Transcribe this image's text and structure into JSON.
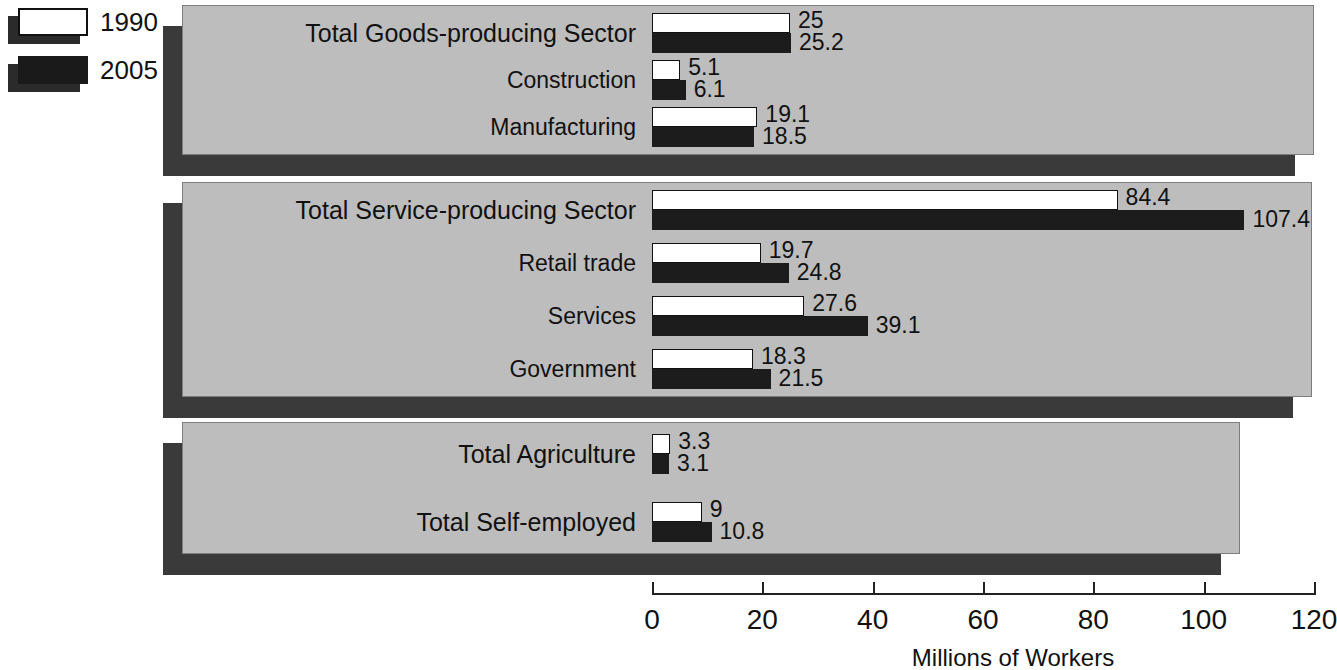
{
  "legend": {
    "items": [
      {
        "label": "1990",
        "swatch": "white-square-icon",
        "color": "#ffffff"
      },
      {
        "label": "2005",
        "swatch": "black-square-icon",
        "color": "#1a1a1a"
      }
    ]
  },
  "axis": {
    "title": "Millions of Workers",
    "ticks": [
      "0",
      "20",
      "40",
      "60",
      "80",
      "100",
      "120"
    ]
  },
  "chart_data": {
    "type": "bar",
    "orientation": "horizontal",
    "title": "",
    "xlabel": "Millions of Workers",
    "ylabel": "",
    "xlim": [
      0,
      120
    ],
    "xticks": [
      0,
      20,
      40,
      60,
      80,
      100,
      120
    ],
    "grid": false,
    "legend_position": "top-left",
    "series": [
      {
        "name": "1990",
        "color": "#ffffff"
      },
      {
        "name": "2005",
        "color": "#1a1a1a"
      }
    ],
    "groups": [
      {
        "name": "Goods-producing",
        "categories": [
          "Total Goods-producing Sector",
          "Construction",
          "Manufacturing"
        ],
        "rows": [
          {
            "label": "Total Goods-producing Sector",
            "emphasis": true,
            "v1990": 25,
            "v2005": 25.2,
            "t1990": "25",
            "t2005": "25.2"
          },
          {
            "label": "Construction",
            "emphasis": false,
            "v1990": 5.1,
            "v2005": 6.1,
            "t1990": "5.1",
            "t2005": "6.1"
          },
          {
            "label": "Manufacturing",
            "emphasis": false,
            "v1990": 19.1,
            "v2005": 18.5,
            "t1990": "19.1",
            "t2005": "18.5"
          }
        ]
      },
      {
        "name": "Service-producing",
        "categories": [
          "Total Service-producing Sector",
          "Retail trade",
          "Services",
          "Government"
        ],
        "rows": [
          {
            "label": "Total Service-producing Sector",
            "emphasis": true,
            "v1990": 84.4,
            "v2005": 107.4,
            "t1990": "84.4",
            "t2005": "107.4"
          },
          {
            "label": "Retail trade",
            "emphasis": false,
            "v1990": 19.7,
            "v2005": 24.8,
            "t1990": "19.7",
            "t2005": "24.8"
          },
          {
            "label": "Services",
            "emphasis": false,
            "v1990": 27.6,
            "v2005": 39.1,
            "t1990": "27.6",
            "t2005": "39.1"
          },
          {
            "label": "Government",
            "emphasis": false,
            "v1990": 18.3,
            "v2005": 21.5,
            "t1990": "18.3",
            "t2005": "21.5"
          }
        ]
      },
      {
        "name": "Agriculture and Self-employed",
        "categories": [
          "Total Agriculture",
          "Total Self-employed"
        ],
        "rows": [
          {
            "label": "Total Agriculture",
            "emphasis": true,
            "v1990": 3.3,
            "v2005": 3.1,
            "t1990": "3.3",
            "t2005": "3.1"
          },
          {
            "label": "Total Self-employed",
            "emphasis": true,
            "v1990": 9,
            "v2005": 10.8,
            "t1990": "9",
            "t2005": "10.8"
          }
        ]
      }
    ]
  }
}
